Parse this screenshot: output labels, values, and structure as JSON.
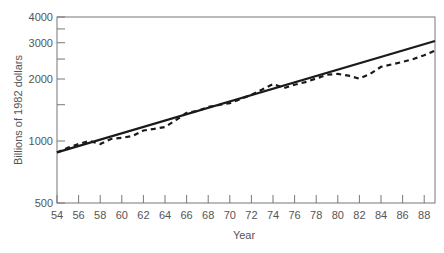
{
  "chart_data": {
    "type": "line",
    "title": "",
    "xlabel": "Year",
    "ylabel": "Billions of 1982 dollars",
    "yscale": "log",
    "ylim": [
      500,
      4000
    ],
    "xlim": [
      54,
      89
    ],
    "grid": false,
    "legend": null,
    "x_ticks": [
      "54",
      "56",
      "58",
      "60",
      "62",
      "64",
      "66",
      "68",
      "70",
      "72",
      "74",
      "76",
      "78",
      "80",
      "82",
      "84",
      "86",
      "88"
    ],
    "y_ticks": [
      {
        "value": 500,
        "label": "500"
      },
      {
        "value": 1000,
        "label": "1000"
      },
      {
        "value": 1500,
        "label": ""
      },
      {
        "value": 2000,
        "label": "2000"
      },
      {
        "value": 2500,
        "label": ""
      },
      {
        "value": 3000,
        "label": "3000"
      },
      {
        "value": 3500,
        "label": ""
      },
      {
        "value": 4000,
        "label": "4000"
      }
    ],
    "series": [
      {
        "name": "Trend",
        "style": "solid",
        "color": "#222222",
        "x": [
          54,
          89
        ],
        "values": [
          880,
          3060
        ]
      },
      {
        "name": "Actual",
        "style": "dashed",
        "color": "#222222",
        "x": [
          54,
          55,
          56,
          57,
          58,
          59,
          60,
          61,
          62,
          63,
          64,
          65,
          66,
          67,
          68,
          69,
          70,
          71,
          72,
          73,
          74,
          75,
          76,
          77,
          78,
          79,
          80,
          81,
          82,
          83,
          84,
          85,
          86,
          87,
          88,
          89
        ],
        "values": [
          878,
          927,
          967,
          1000,
          967,
          1023,
          1036,
          1057,
          1124,
          1145,
          1169,
          1262,
          1369,
          1398,
          1463,
          1495,
          1527,
          1600,
          1678,
          1779,
          1891,
          1806,
          1876,
          1931,
          2012,
          2098,
          2118,
          2075,
          2006,
          2118,
          2289,
          2355,
          2420,
          2500,
          2610,
          2750
        ]
      }
    ]
  }
}
